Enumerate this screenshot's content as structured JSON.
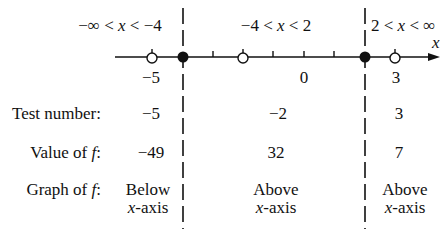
{
  "intervals": [
    {
      "label_pre": "−∞ < ",
      "var": "x",
      "label_post": " < −4"
    },
    {
      "label_pre": "−4 < ",
      "var": "x",
      "label_post": " < 2"
    },
    {
      "label_pre": "2 < ",
      "var": "x",
      "label_post": " < ∞"
    }
  ],
  "axis": {
    "variable": "x",
    "tick_labels": [
      "−5",
      "0",
      "3"
    ],
    "filled_points": [
      -4,
      2
    ],
    "open_points": [
      -5,
      -2,
      3
    ],
    "ticks": [
      -3,
      -1,
      0,
      1
    ]
  },
  "rows": {
    "test_number": {
      "label": "Test number:",
      "values": [
        "−5",
        "−2",
        "3"
      ]
    },
    "value_of_f": {
      "label_pre": "Value of ",
      "label_var": "f",
      "label_post": ":",
      "values": [
        "−49",
        "32",
        "7"
      ]
    },
    "graph_of_f": {
      "label_pre": "Graph of ",
      "label_var": "f",
      "label_post": ":",
      "values": [
        {
          "line1": "Below",
          "line2_var": "x",
          "line2": "-axis"
        },
        {
          "line1": "Above",
          "line2_var": "x",
          "line2": "-axis"
        },
        {
          "line1": "Above",
          "line2_var": "x",
          "line2": "-axis"
        }
      ]
    }
  }
}
